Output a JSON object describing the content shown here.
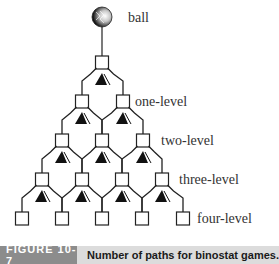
{
  "diagram": {
    "labels": {
      "ball": "ball",
      "level1": "one-level",
      "level2": "two-level",
      "level3": "three-level",
      "level4": "four-level"
    },
    "levels": [
      {
        "name": "root",
        "x": [
          102
        ]
      },
      {
        "name": "one-level",
        "x": [
          82,
          123
        ]
      },
      {
        "name": "two-level",
        "x": [
          62,
          102,
          143
        ]
      },
      {
        "name": "three-level",
        "x": [
          42,
          82,
          122,
          162
        ]
      },
      {
        "name": "four-level",
        "x": [
          22,
          62,
          102,
          142,
          183
        ]
      }
    ],
    "icons": [
      "ball-icon",
      "box-node-icon",
      "pin-deflector-icon"
    ]
  },
  "caption": {
    "figure_number": "FIGURE 10-7",
    "title": "Number of paths for binostat games."
  }
}
